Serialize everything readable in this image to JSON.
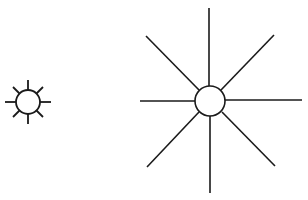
{
  "diagram": {
    "stroke_color": "#1a1a1a",
    "fill_color": "#ffffff",
    "figures": [
      {
        "name": "small-sun",
        "cx": 28,
        "cy": 102,
        "r": 12,
        "ray_inner": 13,
        "ray_outer": 23,
        "rays": 8
      },
      {
        "name": "large-sun",
        "cx": 210,
        "cy": 101,
        "r": 15,
        "rays": 8
      }
    ]
  }
}
